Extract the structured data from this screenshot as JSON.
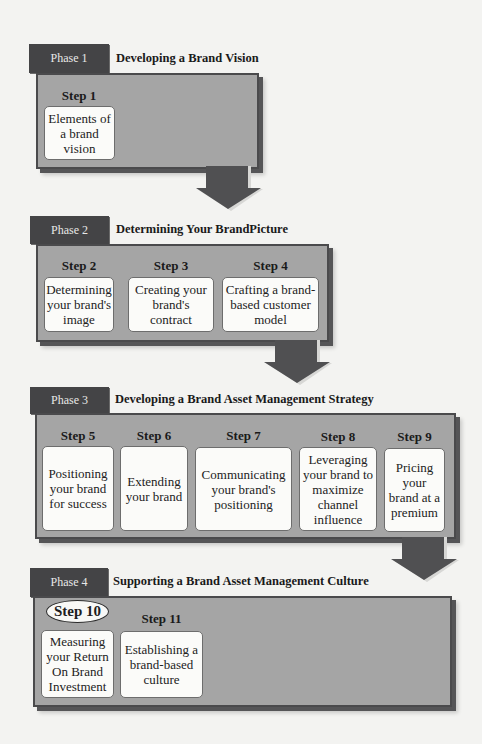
{
  "diagram": {
    "colors": {
      "tab": "#444446",
      "panel": "#a5a5a5",
      "panel_border": "#4a4a4c",
      "card": "#fbfbf9",
      "arrow": "#505052",
      "background": "#f3f3f1"
    },
    "phases": [
      {
        "tab": "Phase 1",
        "title": "Developing a Brand Vision",
        "steps": [
          {
            "label": "Step 1",
            "text": "Elements of a brand vision"
          }
        ]
      },
      {
        "tab": "Phase 2",
        "title": "Determining Your BrandPicture",
        "steps": [
          {
            "label": "Step 2",
            "text": "Determining your brand's image"
          },
          {
            "label": "Step 3",
            "text": "Creating your brand's contract"
          },
          {
            "label": "Step 4",
            "text": "Crafting a brand-based customer model"
          }
        ]
      },
      {
        "tab": "Phase 3",
        "title": "Developing a Brand Asset Management Strategy",
        "steps": [
          {
            "label": "Step 5",
            "text": "Positioning your brand for success"
          },
          {
            "label": "Step 6",
            "text": "Extending your brand"
          },
          {
            "label": "Step 7",
            "text": "Communicating your brand's positioning"
          },
          {
            "label": "Step 8",
            "text": "Leveraging your brand to maximize channel influence"
          },
          {
            "label": "Step 9",
            "text": "Pricing your brand at a premium"
          }
        ]
      },
      {
        "tab": "Phase 4",
        "title": "Supporting a Brand Asset Management Culture",
        "steps": [
          {
            "label": "Step 10",
            "text": "Measuring your Return On Brand Investment",
            "highlighted": true
          },
          {
            "label": "Step 11",
            "text": "Establishing a brand-based culture"
          }
        ]
      }
    ],
    "connectors": [
      "arrow-down",
      "arrow-down",
      "arrow-down"
    ]
  }
}
